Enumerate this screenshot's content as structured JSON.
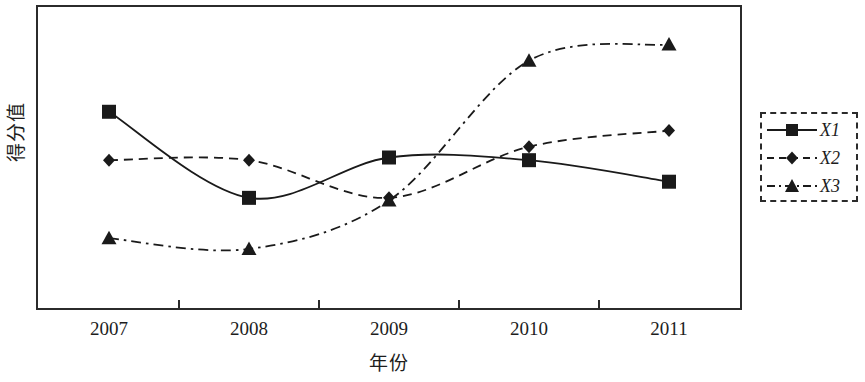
{
  "chart_data": {
    "type": "line",
    "title": "",
    "xlabel": "年份",
    "ylabel": "得分值",
    "categories": [
      "2007",
      "2008",
      "2009",
      "2010",
      "2011"
    ],
    "grid": false,
    "legend_position": "right-outside",
    "ylim": [
      0,
      100
    ],
    "y_tick_labels": [],
    "series": [
      {
        "name": "X1",
        "marker": "filled-square",
        "linestyle": "solid",
        "color": "#1a1a1a",
        "values": [
          67,
          35,
          50,
          49,
          41
        ]
      },
      {
        "name": "X2",
        "marker": "filled-diamond",
        "linestyle": "dashed",
        "color": "#1a1a1a",
        "values": [
          49,
          49,
          35,
          54,
          60
        ]
      },
      {
        "name": "X3",
        "marker": "filled-triangle",
        "linestyle": "dash-dot",
        "color": "#1a1a1a",
        "values": [
          20,
          16,
          34,
          86,
          92
        ]
      }
    ]
  },
  "legend": {
    "entries": [
      {
        "label": "X1"
      },
      {
        "label": "X2"
      },
      {
        "label": "X3"
      }
    ]
  },
  "axes": {
    "x_label": "年份",
    "y_label": "得分值",
    "x_tick_labels": [
      "2007",
      "2008",
      "2009",
      "2010",
      "2011"
    ]
  },
  "colors": {
    "ink": "#1a1a1a",
    "frame": "#2b2b2b",
    "background": "#ffffff"
  }
}
